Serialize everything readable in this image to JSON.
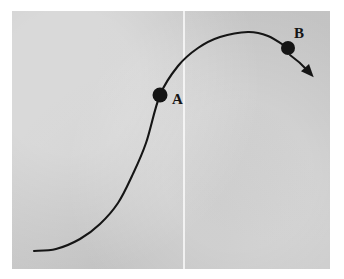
{
  "figure": {
    "title": "",
    "background_color": "#ffffff",
    "panel_color": "#c9c9c9",
    "ink_color": "#151515",
    "crease_color": "#ffffff"
  },
  "labels": {
    "point_a": "A",
    "point_b": "B"
  },
  "icons": {
    "dot_a": "filled-circle-marker",
    "dot_b": "filled-circle-marker",
    "arrow": "arrowhead-down-right"
  },
  "chart_data": {
    "type": "line",
    "title": "",
    "xlabel": "",
    "ylabel": "",
    "grid": false,
    "legend": null,
    "axis_visible": false,
    "xlim": [
      12,
      330
    ],
    "ylim": [
      269,
      11
    ],
    "curve": {
      "name": "sigmoid-then-decline",
      "shape": "s-curve rising to a maximum then falling",
      "points": [
        [
          34,
          251
        ],
        [
          56,
          249
        ],
        [
          80,
          239
        ],
        [
          100,
          224
        ],
        [
          118,
          203
        ],
        [
          132,
          176
        ],
        [
          146,
          143
        ],
        [
          160,
          95
        ],
        [
          178,
          66
        ],
        [
          198,
          48
        ],
        [
          220,
          37
        ],
        [
          248,
          32
        ],
        [
          268,
          36
        ],
        [
          288,
          48
        ]
      ]
    },
    "markers": [
      {
        "label": "A",
        "x": 160,
        "y": 95,
        "radius": 7.5,
        "label_x": 176,
        "label_y": 100
      },
      {
        "label": "B",
        "x": 288,
        "y": 48,
        "radius": 7.0,
        "label_x": 298,
        "label_y": 34
      }
    ],
    "annotations": [
      {
        "name": "decline-arrow",
        "from": [
          290,
          55
        ],
        "control": [
          300,
          62
        ],
        "to": [
          309,
          72
        ],
        "style": "curved arrow with solid triangular head pointing down-right"
      },
      {
        "name": "vertical-crease",
        "x": 183,
        "y_top": 11,
        "y_bottom": 269,
        "style": "faint near-white vertical line"
      }
    ]
  }
}
